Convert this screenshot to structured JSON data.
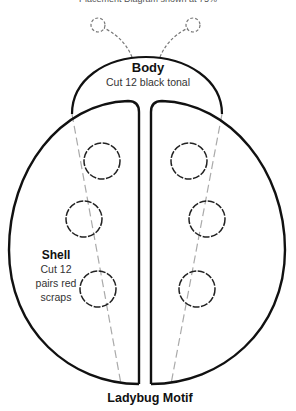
{
  "header": {
    "text": "Placement Diagram shown at 75%"
  },
  "body_piece": {
    "title": "Body",
    "instruction": "Cut 12 black tonal"
  },
  "shell_piece": {
    "title": "Shell",
    "instruction_lines": [
      "Cut 12",
      "pairs red",
      "scraps"
    ]
  },
  "caption": "Ladybug Motif",
  "colors": {
    "outline": "#111111",
    "guide": "#aaaaaa",
    "spots": "#222222"
  }
}
